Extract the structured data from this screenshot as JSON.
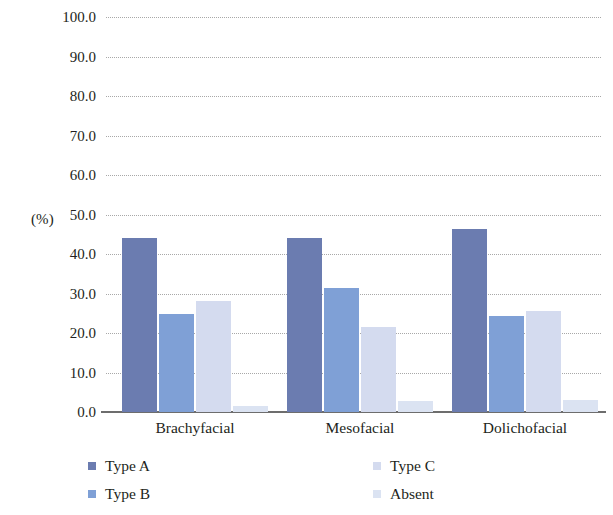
{
  "chart_data": {
    "type": "bar",
    "title": "",
    "subtitle": "",
    "xlabel": "",
    "ylabel": "(%)",
    "ylim": [
      0,
      100
    ],
    "ytick_step": 10,
    "ytick_labels": [
      "100.0",
      "90.0",
      "80.0",
      "70.0",
      "60.0",
      "50.0",
      "40.0",
      "30.0",
      "20.0",
      "10.0",
      "0.0"
    ],
    "ytick_values": [
      100,
      90,
      80,
      70,
      60,
      50,
      40,
      30,
      20,
      10,
      0
    ],
    "categories": [
      "Brachyfacial",
      "Mesofacial",
      "Dolichofacial"
    ],
    "grid": "horizontal-dotted",
    "legend_position": "bottom",
    "series": [
      {
        "name": "Type A",
        "color": "#6b7cb0",
        "values": [
          44.0,
          44.0,
          46.3
        ]
      },
      {
        "name": "Type B",
        "color": "#7fa0d6",
        "values": [
          24.9,
          31.5,
          24.2
        ]
      },
      {
        "name": "Type C",
        "color": "#d4dbef",
        "values": [
          28.2,
          21.5,
          25.6
        ]
      },
      {
        "name": "Absent",
        "color": "#dbe3f2",
        "values": [
          1.6,
          2.7,
          3.0
        ]
      }
    ]
  },
  "axis": {
    "unit_label": "(%)"
  },
  "legend": {
    "items": [
      {
        "label": "Type A",
        "color": "#6b7cb0"
      },
      {
        "label": "Type B",
        "color": "#7fa0d6"
      },
      {
        "label": "Type C",
        "color": "#d4dbef"
      },
      {
        "label": "Absent",
        "color": "#dbe3f2"
      }
    ]
  },
  "colors": {
    "gridline": "#9a9a9a",
    "axis": "#6d6d6d",
    "text": "#231f20",
    "background": "#ffffff"
  }
}
